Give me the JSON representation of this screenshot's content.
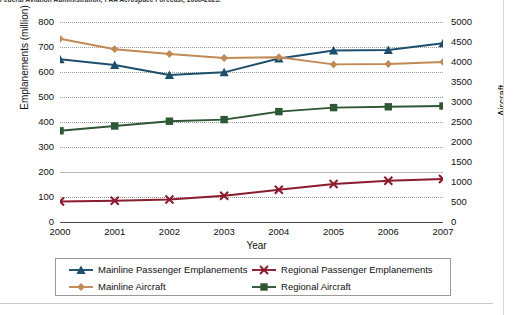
{
  "source_note": "Federal Aviation Administration, FAA Aerospace Forecast, 2008-2025.",
  "axes": {
    "xlabel": "Year",
    "ylabel_left": "Emplanements (million)",
    "ylabel_right": "Aircraft",
    "left_ticks": [
      "800",
      "700",
      "600",
      "500",
      "400",
      "300",
      "200",
      "100",
      "0"
    ],
    "right_ticks": [
      "5000",
      "4500",
      "4000",
      "3500",
      "3000",
      "2500",
      "2000",
      "1500",
      "1000",
      "500",
      "0"
    ],
    "x_ticks": [
      "2000",
      "2001",
      "2002",
      "2003",
      "2004",
      "2005",
      "2006",
      "2007"
    ]
  },
  "legend": {
    "items": [
      {
        "label": "Mainline Passenger Emplanements",
        "color": "#1d4f6c",
        "marker": "triangle"
      },
      {
        "label": "Regional Passenger Emplanements",
        "color": "#8b1b2e",
        "marker": "x"
      },
      {
        "label": "Mainline Aircraft",
        "color": "#c08a55",
        "marker": "diamond"
      },
      {
        "label": "Regional Aircraft",
        "color": "#2e5734",
        "marker": "square"
      }
    ]
  },
  "chart_data": {
    "type": "line",
    "title": "",
    "xlabel": "Year",
    "ylabel": "Emplanements (million)",
    "ylabel_secondary": "Aircraft",
    "categories": [
      "2000",
      "2001",
      "2002",
      "2003",
      "2004",
      "2005",
      "2006",
      "2007"
    ],
    "ylim": [
      0,
      800
    ],
    "ylim_secondary": [
      0,
      5000
    ],
    "grid": true,
    "legend_position": "bottom",
    "series": [
      {
        "name": "Mainline Passenger Emplanements",
        "axis": "left",
        "color": "#1d4f6c",
        "marker": "triangle",
        "values": [
          651,
          628,
          588,
          599,
          654,
          686,
          688,
          715
        ]
      },
      {
        "name": "Regional Passenger Emplanements",
        "axis": "left",
        "color": "#8b1b2e",
        "marker": "x",
        "values": [
          82,
          85,
          90,
          105,
          129,
          152,
          165,
          172
        ]
      },
      {
        "name": "Mainline Aircraft",
        "axis": "right",
        "color": "#c08a55",
        "marker": "diamond",
        "values": [
          4580,
          4320,
          4200,
          4100,
          4120,
          3940,
          3950,
          4000
        ]
      },
      {
        "name": "Regional Aircraft",
        "axis": "right",
        "color": "#2e5734",
        "marker": "square",
        "values": [
          2280,
          2400,
          2520,
          2560,
          2760,
          2860,
          2880,
          2900
        ]
      }
    ]
  }
}
